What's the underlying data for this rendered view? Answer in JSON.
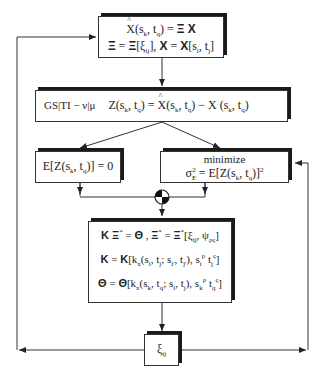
{
  "diagram": {
    "boxes": {
      "estimator": {
        "line1": "X̂(s_k, t_q) = Ξ X",
        "line2": "Ξ = Ξ[ξ_ij], X = X[s_i, t_j]"
      },
      "error": {
        "label": "GS|TI − v|μ",
        "equation": "Z(s_k, t_q) = X̂(s_k, t_q) − X(s_k, t_q)"
      },
      "unbiased": {
        "equation": "E[Z(s_k, t_q)] = 0"
      },
      "minimize": {
        "label": "minimize",
        "equation": "σ²_E = E[Z(s_k, t_q)]²"
      },
      "system": {
        "line1": "K Ξ* = Θ ,  Ξ* = Ξ*[ξ_ij, ψ_ρς]",
        "line2": "K = K[k_x(s_i, t_j; s_i', t_j'), s_i^ρ t_j^ς]",
        "line3": "Θ = Θ[k_x(s_k, t_q; s_i, t_j), s_k^ρ t_q^ς]"
      },
      "weights": {
        "label": "ξ_ij"
      }
    },
    "junction": {
      "type": "summing-junction"
    },
    "colors": {
      "line": "#333333",
      "shadow": "#1a1a1a",
      "background": "#ffffff"
    }
  }
}
